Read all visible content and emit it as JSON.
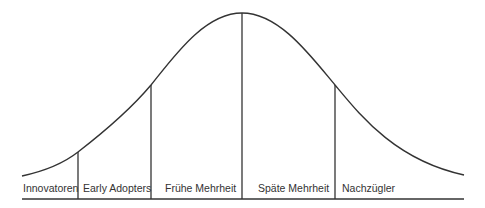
{
  "diagram": {
    "type": "diffusion-of-innovations-bell-curve",
    "line_color": "#333333",
    "segments": [
      {
        "label": "Innovatoren"
      },
      {
        "label": "Early Adopters"
      },
      {
        "label": "Frühe Mehrheit"
      },
      {
        "label": "Späte Mehrheit"
      },
      {
        "label": "Nachzügler"
      }
    ]
  }
}
